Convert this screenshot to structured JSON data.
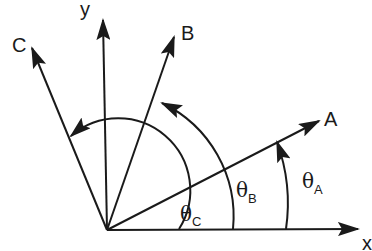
{
  "diagram": {
    "type": "vector-angle-diagram",
    "stroke_color": "#1a1a1a",
    "background": "#ffffff",
    "axes": {
      "x_label": "x",
      "y_label": "y"
    },
    "vectors": [
      {
        "name": "A",
        "label": "A"
      },
      {
        "name": "B",
        "label": "B"
      },
      {
        "name": "C",
        "label": "C"
      }
    ],
    "angles": [
      {
        "name": "theta_A",
        "symbol": "θ",
        "subscript": "A",
        "from": "x",
        "to": "A"
      },
      {
        "name": "theta_B",
        "symbol": "θ",
        "subscript": "B",
        "from": "x",
        "to": "B"
      },
      {
        "name": "theta_C",
        "symbol": "θ",
        "subscript": "C",
        "from": "x",
        "to": "C"
      }
    ]
  }
}
